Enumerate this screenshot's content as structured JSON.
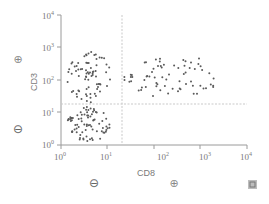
{
  "chart_data": {
    "type": "scatter",
    "title": "",
    "xlabel": "CD8",
    "ylabel": "CD3",
    "xscale": "log",
    "yscale": "log",
    "xlim": [
      1,
      10000
    ],
    "ylim": [
      1,
      10000
    ],
    "x_ticks": [
      "10^0",
      "10^1",
      "10^2",
      "10^3",
      "10^4"
    ],
    "y_ticks": [
      "10^0",
      "10^1",
      "10^2",
      "10^3",
      "10^4"
    ],
    "grid": false,
    "gates": {
      "vertical_x": 15,
      "horizontal_y": 18
    },
    "annotations": {
      "y_positive": "⊕",
      "y_negative": "⊖",
      "x_negative": "⊖",
      "x_positive": "⊕"
    },
    "populations": [
      {
        "name": "CD3+ CD8- (upper left)",
        "x_range": [
          1.3,
          12
        ],
        "y_range": [
          20,
          800
        ],
        "count_approx": 75
      },
      {
        "name": "CD3- CD8- (lower left)",
        "x_range": [
          1.3,
          12
        ],
        "y_range": [
          1.3,
          15
        ],
        "count_approx": 80
      },
      {
        "name": "CD3+ CD8+ (upper right)",
        "x_range": [
          20,
          3000
        ],
        "y_range": [
          25,
          600
        ],
        "count_approx": 70
      }
    ]
  },
  "labels": {
    "ylabel": "CD3",
    "xlabel": "CD8",
    "y_plus": "⊕",
    "y_minus": "⊖",
    "x_minus": "⊖",
    "x_plus": "⊕",
    "corner_icon": "⛶"
  },
  "ticks": {
    "y": [
      {
        "base": "10",
        "exp": "4"
      },
      {
        "base": "10",
        "exp": "3"
      },
      {
        "base": "10",
        "exp": "2"
      },
      {
        "base": "10",
        "exp": "1"
      },
      {
        "base": "10",
        "exp": "0"
      }
    ],
    "x": [
      {
        "base": "10",
        "exp": "0"
      },
      {
        "base": "10",
        "exp": "1"
      },
      {
        "base": "10",
        "exp": "2"
      },
      {
        "base": "10",
        "exp": "3"
      },
      {
        "base": "10",
        "exp": "4"
      }
    ]
  }
}
